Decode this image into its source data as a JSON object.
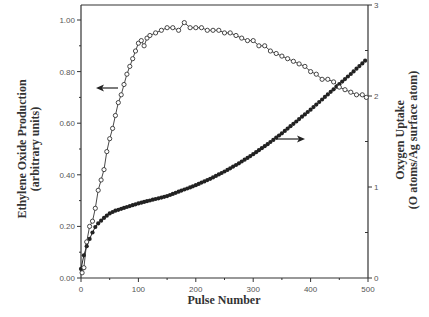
{
  "chart_data": {
    "type": "scatter",
    "title": "",
    "xlabel": "Pulse Number",
    "ylabel_left": [
      "Ethylene Oxide Production",
      "(arbitrary units)"
    ],
    "ylabel_right": [
      "Oxygen Uptake",
      "(O atoms/Ag surface atom)"
    ],
    "xlim": [
      0,
      500
    ],
    "ylim_left": [
      0,
      1.0
    ],
    "ylim_right": [
      0,
      3
    ],
    "x_ticks": [
      "0",
      "100",
      "200",
      "300",
      "400",
      "500"
    ],
    "y_ticks_left": [
      "0.00",
      "0.20",
      "0.40",
      "0.60",
      "0.80",
      "1.00"
    ],
    "y_ticks_right": [
      "0",
      "1",
      "2",
      "3"
    ],
    "grid": false,
    "legend": "none (arrows indicate axis for each series)",
    "series": [
      {
        "name": "Ethylene Oxide Production",
        "axis": "left",
        "marker": "open-circle",
        "x": [
          2,
          5,
          10,
          15,
          20,
          25,
          30,
          35,
          40,
          45,
          50,
          55,
          60,
          65,
          70,
          75,
          80,
          85,
          90,
          95,
          100,
          105,
          110,
          115,
          120,
          130,
          140,
          150,
          160,
          170,
          180,
          190,
          200,
          210,
          220,
          230,
          240,
          250,
          260,
          270,
          280,
          290,
          300,
          310,
          320,
          330,
          340,
          350,
          360,
          370,
          380,
          390,
          400,
          410,
          420,
          430,
          440,
          450,
          460,
          470,
          480,
          490,
          497
        ],
        "values": [
          0.02,
          0.04,
          0.14,
          0.2,
          0.22,
          0.27,
          0.34,
          0.38,
          0.42,
          0.49,
          0.54,
          0.58,
          0.63,
          0.68,
          0.71,
          0.75,
          0.79,
          0.82,
          0.85,
          0.88,
          0.91,
          0.92,
          0.9,
          0.93,
          0.94,
          0.95,
          0.96,
          0.97,
          0.97,
          0.96,
          0.99,
          0.97,
          0.97,
          0.97,
          0.96,
          0.96,
          0.96,
          0.95,
          0.95,
          0.94,
          0.93,
          0.92,
          0.92,
          0.9,
          0.9,
          0.88,
          0.87,
          0.86,
          0.85,
          0.84,
          0.83,
          0.82,
          0.8,
          0.79,
          0.77,
          0.77,
          0.76,
          0.74,
          0.73,
          0.72,
          0.71,
          0.71,
          0.7
        ]
      },
      {
        "name": "Oxygen Uptake",
        "axis": "right",
        "marker": "filled-circle",
        "x": [
          0,
          5,
          10,
          15,
          20,
          25,
          30,
          40,
          50,
          60,
          70,
          80,
          90,
          100,
          125,
          150,
          175,
          200,
          225,
          250,
          275,
          300,
          325,
          350,
          375,
          400,
          425,
          450,
          475,
          497
        ],
        "values": [
          0.1,
          0.25,
          0.35,
          0.43,
          0.5,
          0.56,
          0.6,
          0.66,
          0.71,
          0.74,
          0.76,
          0.78,
          0.8,
          0.82,
          0.86,
          0.9,
          0.96,
          1.02,
          1.09,
          1.17,
          1.26,
          1.36,
          1.47,
          1.59,
          1.72,
          1.85,
          1.99,
          2.13,
          2.27,
          2.4
        ]
      }
    ],
    "annotations": [
      {
        "type": "arrow-left",
        "near_pulse": 60,
        "points_to": "left axis",
        "series": "Ethylene Oxide Production"
      },
      {
        "type": "arrow-right",
        "near_pulse": 320,
        "points_to": "right axis",
        "series": "Oxygen Uptake"
      }
    ]
  }
}
